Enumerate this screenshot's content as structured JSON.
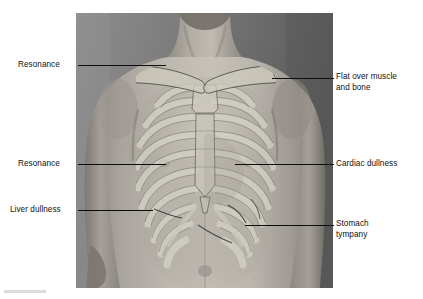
{
  "figure": {
    "background_color": "#ffffff"
  },
  "photo": {
    "description": "Black and white photograph of a male torso, anterior view, with the skeleton of the thorax (clavicles, sternum, ribs and costal margin) overlaid as a pale translucent drawing",
    "alt_text": "Anterior chest with rib cage overlay showing percussion zones",
    "frame_color": "#6e6e6e",
    "overlay_bone_color": "#c9c9c0",
    "outline_color": "#3a3a38"
  },
  "labels": [
    {
      "id": "resonance-upper",
      "name": "resonance-upper-label",
      "text": "Resonance",
      "side": "left",
      "x": 18,
      "y": 60,
      "leader": {
        "x1": 78,
        "y1": 65,
        "x2": 166,
        "y2": 65
      }
    },
    {
      "id": "flat-over-muscle-and-bone",
      "name": "flat-over-muscle-label",
      "text": "Flat over muscle\nand bone",
      "side": "right",
      "x": 336,
      "y": 72,
      "leader": {
        "x1": 272,
        "y1": 78,
        "x2": 334,
        "y2": 78
      }
    },
    {
      "id": "resonance-lower",
      "name": "resonance-lower-label",
      "text": "Resonance",
      "side": "left",
      "x": 18,
      "y": 159,
      "leader": {
        "x1": 78,
        "y1": 164,
        "x2": 166,
        "y2": 164
      }
    },
    {
      "id": "cardiac-dullness",
      "name": "cardiac-dullness-label",
      "text": "Cardiac dullness",
      "side": "right",
      "x": 336,
      "y": 159,
      "leader": {
        "x1": 235,
        "y1": 164,
        "x2": 334,
        "y2": 164
      }
    },
    {
      "id": "liver-dullness",
      "name": "liver-dullness-label",
      "text": "Liver dullness",
      "side": "left",
      "x": 10,
      "y": 205,
      "leader": {
        "x1": 78,
        "y1": 210,
        "x2": 153,
        "y2": 210
      }
    },
    {
      "id": "stomach-tympany",
      "name": "stomach-tympany-label",
      "text": "Stomach\ntympany",
      "side": "right",
      "x": 336,
      "y": 219,
      "leader": {
        "x1": 245,
        "y1": 225,
        "x2": 334,
        "y2": 225
      }
    }
  ],
  "marks": {
    "bottom_rule_color": "#dcdcdc"
  }
}
